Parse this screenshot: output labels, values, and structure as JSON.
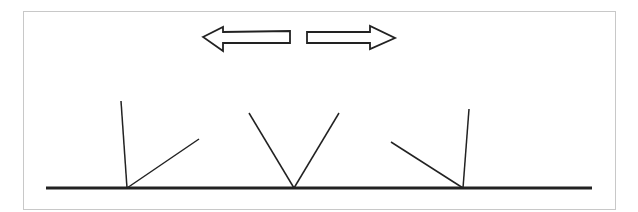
{
  "diagram": {
    "colors": {
      "stroke": "#222222",
      "frame": "#c8c8c8",
      "background": "#ffffff"
    },
    "arrows": [
      {
        "name": "left-arrow",
        "direction": "left"
      },
      {
        "name": "right-arrow",
        "direction": "right"
      }
    ],
    "figures": [
      {
        "name": "figure-left",
        "shape": "near-vertical line plus line slanting up-right"
      },
      {
        "name": "figure-center",
        "shape": "symmetric V"
      },
      {
        "name": "figure-right",
        "shape": "line slanting up-left plus near-vertical line"
      }
    ]
  }
}
